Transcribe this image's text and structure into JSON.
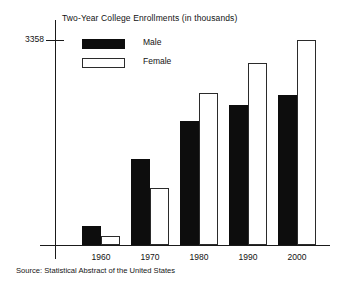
{
  "chart_data": {
    "type": "bar",
    "title": "Two-Year College Enrollments (in thousands)",
    "xlabel": "",
    "ylabel": "",
    "categories": [
      "1960",
      "1970",
      "1980",
      "1990",
      "2000"
    ],
    "series": [
      {
        "name": "Male",
        "color": "#0d0d0d",
        "values": [
          311,
          1409,
          2031,
          2293,
          2457
        ]
      },
      {
        "name": "Female",
        "color": "#ffffff",
        "values": [
          147,
          934,
          2490,
          2981,
          3358
        ]
      }
    ],
    "ylim": [
      0,
      3358
    ],
    "yticks": [
      3358
    ],
    "ytick_labels": [
      "3358"
    ],
    "grid": false,
    "legend_position": "upper-left-inside",
    "source_note": "Source: Statistical Abstract of the United States"
  },
  "legend": {
    "items": [
      {
        "label": "Male",
        "swatch": "filled-black-swatch"
      },
      {
        "label": "Female",
        "swatch": "outlined-white-swatch"
      }
    ]
  },
  "axis": {
    "y_tick_value": "3358"
  }
}
